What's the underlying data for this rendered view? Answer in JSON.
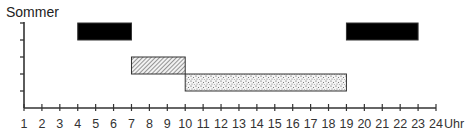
{
  "chart_data": {
    "type": "bar",
    "subtype": "gantt-timeline",
    "title": "Sommer",
    "xlabel": "Uhr",
    "ylabel": "",
    "xlim": [
      1,
      24
    ],
    "x_ticks": [
      1,
      2,
      3,
      4,
      5,
      6,
      7,
      8,
      9,
      10,
      11,
      12,
      13,
      14,
      15,
      16,
      17,
      18,
      19,
      20,
      21,
      22,
      23,
      24
    ],
    "y_rows": 5,
    "grid": false,
    "legend": null,
    "bars": [
      {
        "row": 1,
        "start": 4,
        "end": 7,
        "fill": "solid-black",
        "color": "#000000"
      },
      {
        "row": 1,
        "start": 19,
        "end": 23,
        "fill": "solid-black",
        "color": "#000000"
      },
      {
        "row": 3,
        "start": 7,
        "end": 10,
        "fill": "diagonal-hatch",
        "color": "#888888"
      },
      {
        "row": 4,
        "start": 10,
        "end": 19,
        "fill": "stipple-dots",
        "color": "#777777"
      }
    ]
  }
}
